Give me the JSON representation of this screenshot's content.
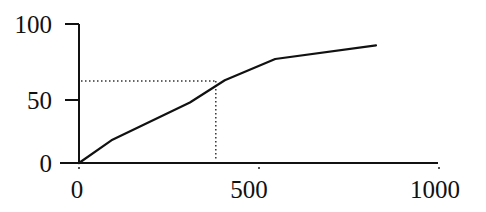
{
  "chart_data": {
    "type": "line",
    "title": "",
    "xlabel": "",
    "ylabel": "",
    "xlim": [
      0,
      1000
    ],
    "ylim": [
      0,
      100
    ],
    "x_ticks": [
      0,
      500,
      1000
    ],
    "y_ticks": [
      0,
      50,
      100
    ],
    "x_tick_labels": [
      "0",
      "500",
      "1000"
    ],
    "y_tick_labels": [
      "0",
      "50",
      "100"
    ],
    "grid": false,
    "legend": "none",
    "series": [
      {
        "name": "curve",
        "x": [
          0,
          90,
          308,
          405,
          545,
          825
        ],
        "y": [
          0,
          18,
          48,
          63,
          77,
          86
        ]
      }
    ],
    "reference_lines": {
      "x": 380,
      "y": 62.5,
      "style": "dotted"
    },
    "colors": {
      "line": "#111111",
      "axis": "#111111"
    }
  }
}
